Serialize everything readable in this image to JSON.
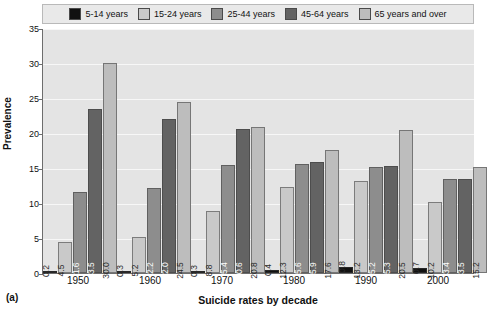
{
  "chart_data": {
    "type": "bar",
    "title": "",
    "xlabel": "Suicide rates by decade",
    "ylabel": "Prevalence",
    "categories": [
      "1950",
      "1960",
      "1970",
      "1980",
      "1990",
      "2000"
    ],
    "ylim": [
      0,
      35
    ],
    "yticks": [
      "0",
      "5",
      "10",
      "15",
      "20",
      "25",
      "30",
      "35"
    ],
    "grid": true,
    "legend_position": "top",
    "series": [
      {
        "name": "5-14 years",
        "color": "#111111",
        "values": [
          0.2,
          0.3,
          0.3,
          0.4,
          0.8,
          0.7
        ]
      },
      {
        "name": "15-24 years",
        "color": "#c9c9c9",
        "values": [
          4.5,
          5.2,
          8.8,
          12.3,
          13.2,
          10.2
        ]
      },
      {
        "name": "25-44 years",
        "color": "#8d8d8d",
        "values": [
          11.6,
          12.2,
          15.4,
          15.6,
          15.2,
          13.4
        ]
      },
      {
        "name": "45-64 years",
        "color": "#636363",
        "values": [
          23.5,
          22.0,
          20.6,
          15.9,
          15.3,
          13.5
        ]
      },
      {
        "name": "65 years and over",
        "color": "#bdbdbd",
        "values": [
          30.0,
          24.5,
          20.8,
          17.6,
          20.5,
          15.2
        ]
      }
    ]
  },
  "figure": {
    "panel_label": "(a)"
  }
}
